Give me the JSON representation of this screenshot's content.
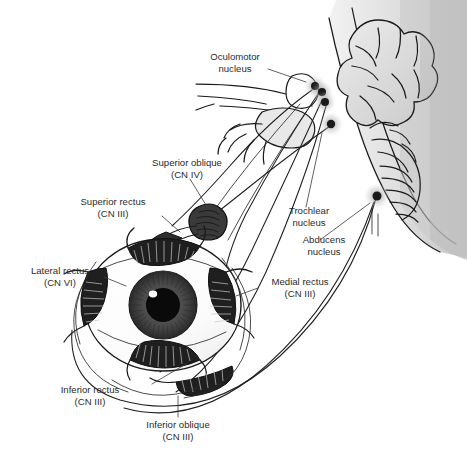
{
  "figure": {
    "background_color": "#ffffff",
    "text_color": "#2b2b2b",
    "line_color": "#1a1a1a"
  },
  "labels": {
    "oculomotor_nucleus": {
      "line1": "Oculomotor",
      "line2": "nucleus"
    },
    "superior_oblique": {
      "line1": "Superior oblique",
      "line2": "(CN IV)"
    },
    "superior_rectus": {
      "line1": "Superior rectus",
      "line2": "(CN III)"
    },
    "lateral_rectus": {
      "line1": "Lateral rectus",
      "line2": "(CN VI)"
    },
    "trochlear_nucleus": {
      "line1": "Trochlear",
      "line2": "nucleus"
    },
    "abducens_nucleus": {
      "line1": "Abducens",
      "line2": "nucleus"
    },
    "medial_rectus": {
      "line1": "Medial rectus",
      "line2": "(CN III)"
    },
    "inferior_rectus": {
      "line1": "Inferior rectus",
      "line2": "(CN III)"
    },
    "inferior_oblique": {
      "line1": "Inferior oblique",
      "line2": "(CN III)"
    }
  },
  "nuclei": [
    {
      "name": "oculomotor-nucleus-upper",
      "cx": 315,
      "cy": 86,
      "r": 4.0,
      "halo": 11
    },
    {
      "name": "oculomotor-nucleus-mid",
      "cx": 322,
      "cy": 92,
      "r": 4.0,
      "halo": 11
    },
    {
      "name": "oculomotor-nucleus-lower",
      "cx": 325,
      "cy": 102,
      "r": 4.0,
      "halo": 11
    },
    {
      "name": "trochlear-nucleus",
      "cx": 331,
      "cy": 124,
      "r": 4.2,
      "halo": 12
    },
    {
      "name": "abducens-nucleus",
      "cx": 377,
      "cy": 196,
      "r": 4.5,
      "halo": 13
    }
  ],
  "muscles": [
    {
      "name": "superior-rectus",
      "nerve": "CN III"
    },
    {
      "name": "inferior-rectus",
      "nerve": "CN III"
    },
    {
      "name": "medial-rectus",
      "nerve": "CN III"
    },
    {
      "name": "inferior-oblique",
      "nerve": "CN III"
    },
    {
      "name": "superior-oblique",
      "nerve": "CN IV"
    },
    {
      "name": "lateral-rectus",
      "nerve": "CN VI"
    }
  ],
  "eye": {
    "sclera_color": "#fdfdfd",
    "iris_color": "#4a4a4a",
    "pupil_color": "#0a0a0a",
    "highlight_color": "#ffffff"
  },
  "brainstem": {
    "fill_light": "#e6e6e6",
    "fill_mid": "#d4d4d4",
    "fill_dark": "#bdbdbd"
  }
}
